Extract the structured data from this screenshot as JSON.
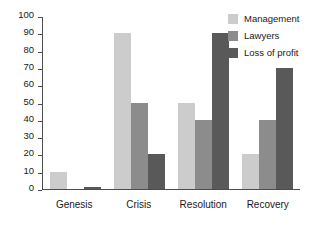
{
  "chart_data": {
    "type": "bar",
    "title": "",
    "subtitle": "",
    "xlabel": "",
    "ylabel": "",
    "categories": [
      "Genesis",
      "Crisis",
      "Resolution",
      "Recovery"
    ],
    "series": [
      {
        "name": "Management",
        "color": "#cccccc",
        "values": [
          10,
          90,
          50,
          20
        ]
      },
      {
        "name": "Lawyers",
        "color": "#8c8c8c",
        "values": [
          0,
          50,
          40,
          40
        ]
      },
      {
        "name": "Loss of profit",
        "color": "#595959",
        "values": [
          1,
          20,
          90,
          70
        ]
      }
    ],
    "ylim": [
      0,
      100
    ],
    "ytick_step": 10,
    "yticks": [
      100,
      90,
      80,
      70,
      60,
      50,
      40,
      30,
      20,
      10,
      0
    ],
    "ytick_labels": [
      "100",
      "90",
      "80",
      "70",
      "60",
      "50",
      "40",
      "30",
      "20",
      "10",
      "0"
    ],
    "grid": false,
    "legend_position": "top-right",
    "axis_color": "#4d4d4d",
    "background": "#ffffff",
    "annotations": []
  }
}
